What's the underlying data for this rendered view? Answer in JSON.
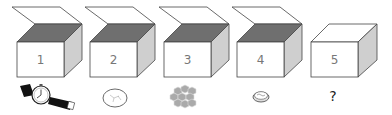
{
  "diagram": {
    "boxes": [
      {
        "label": "1",
        "open": true,
        "item": "wristwatch-icon"
      },
      {
        "label": "2",
        "open": true,
        "item": "rock-icon"
      },
      {
        "label": "3",
        "open": true,
        "item": "honeycomb-icon"
      },
      {
        "label": "4",
        "open": true,
        "item": "coin-icon"
      },
      {
        "label": "5",
        "open": false,
        "item": "unknown",
        "item_text": "?"
      }
    ],
    "colors": {
      "top_dark": "#6f6f6f",
      "side_light": "#cfcfcf",
      "front": "#ffffff",
      "stroke": "#444444"
    }
  }
}
